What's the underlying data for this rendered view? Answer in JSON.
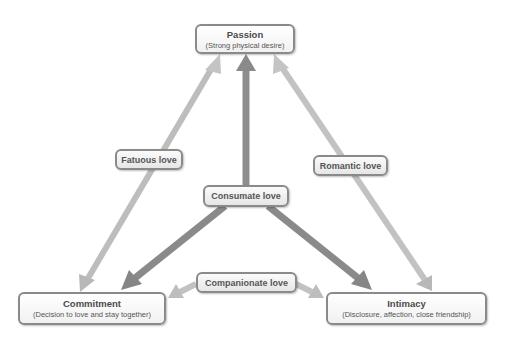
{
  "nodes": {
    "passion": {
      "title": "Passion",
      "subtitle": "(Strong physical desire)"
    },
    "commitment": {
      "title": "Commitment",
      "subtitle": "(Decision to love and stay together)"
    },
    "intimacy": {
      "title": "Intimacy",
      "subtitle": "(Disclosure, affection, close friendship)"
    }
  },
  "edges": {
    "fatuous": {
      "label": "Fatuous love",
      "between": [
        "Passion",
        "Commitment"
      ]
    },
    "romantic": {
      "label": "Romantic love",
      "between": [
        "Passion",
        "Intimacy"
      ]
    },
    "companionate": {
      "label": "Companionate love",
      "between": [
        "Commitment",
        "Intimacy"
      ]
    },
    "consumate": {
      "label": "Consumate love",
      "between": [
        "Passion",
        "Commitment",
        "Intimacy"
      ]
    }
  },
  "colors": {
    "light_arrow": "#c2c2c2",
    "dark_arrow": "#8c8c8c",
    "box_border": "#8a8a8a",
    "text": "#4a4a4a"
  }
}
